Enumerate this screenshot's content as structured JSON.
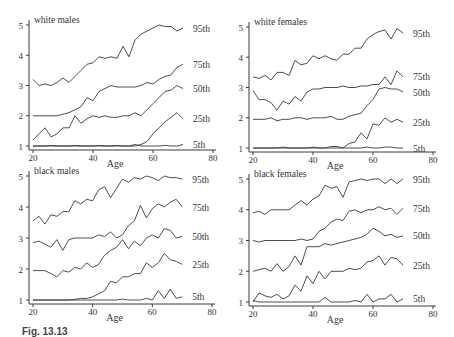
{
  "figure": {
    "caption_visible": "Fig. 13.13",
    "caption_note": "caption cut off at bottom edge"
  },
  "chart_data": [
    {
      "type": "line",
      "title": "white males",
      "xlabel": "Age",
      "ylabel": "",
      "xlim": [
        20,
        80
      ],
      "ylim": [
        1,
        5
      ],
      "xticks": [
        20,
        40,
        60,
        80
      ],
      "yticks": [
        1,
        2,
        3,
        4,
        5
      ],
      "grid": false,
      "legend_position": "right-end labels",
      "x": [
        20,
        22,
        24,
        26,
        28,
        30,
        32,
        34,
        36,
        38,
        40,
        42,
        44,
        46,
        48,
        50,
        52,
        54,
        56,
        58,
        60,
        62,
        64,
        66,
        68,
        70
      ],
      "series": [
        {
          "name": "95th",
          "values": [
            3.2,
            3.0,
            3.05,
            3.0,
            3.1,
            3.25,
            3.1,
            3.3,
            3.5,
            3.7,
            3.75,
            3.95,
            3.9,
            3.95,
            3.9,
            4.3,
            3.95,
            4.5,
            4.7,
            4.8,
            4.9,
            5.0,
            4.95,
            4.95,
            4.8,
            4.9
          ]
        },
        {
          "name": "75th",
          "values": [
            2.0,
            2.0,
            2.0,
            2.0,
            2.0,
            2.05,
            2.1,
            2.2,
            2.3,
            2.6,
            2.5,
            2.8,
            2.9,
            3.0,
            2.95,
            2.95,
            2.95,
            2.95,
            3.0,
            3.1,
            3.05,
            3.2,
            3.3,
            3.35,
            3.6,
            3.7
          ]
        },
        {
          "name": "50th",
          "values": [
            1.2,
            1.4,
            1.6,
            1.3,
            1.4,
            1.6,
            1.6,
            2.0,
            1.75,
            1.9,
            2.0,
            1.95,
            2.0,
            1.95,
            1.95,
            2.0,
            2.0,
            2.1,
            2.0,
            2.2,
            2.4,
            2.6,
            2.8,
            2.85,
            3.0,
            2.9
          ]
        },
        {
          "name": "25th",
          "values": [
            1.0,
            1.0,
            1.0,
            1.0,
            1.0,
            1.0,
            1.0,
            1.0,
            1.0,
            1.0,
            1.0,
            1.0,
            1.0,
            1.0,
            1.0,
            1.0,
            1.0,
            1.0,
            1.05,
            1.15,
            1.4,
            1.6,
            1.8,
            1.95,
            2.1,
            1.9
          ]
        },
        {
          "name": "5th",
          "values": [
            1.0,
            1.0,
            1.0,
            1.02,
            1.0,
            1.0,
            1.0,
            1.02,
            1.0,
            1.0,
            1.0,
            1.02,
            1.0,
            1.0,
            1.02,
            1.0,
            1.0,
            1.05,
            1.0,
            1.0,
            1.0,
            1.0,
            1.02,
            1.0,
            1.0,
            1.05
          ]
        }
      ]
    },
    {
      "type": "line",
      "title": "white females",
      "xlabel": "Age",
      "ylabel": "",
      "xlim": [
        20,
        80
      ],
      "ylim": [
        1,
        5
      ],
      "xticks": [
        20,
        40,
        60,
        80
      ],
      "yticks": [
        1,
        2,
        3,
        4,
        5
      ],
      "grid": false,
      "legend_position": "right-end labels",
      "x": [
        20,
        22,
        24,
        26,
        28,
        30,
        32,
        34,
        36,
        38,
        40,
        42,
        44,
        46,
        48,
        50,
        52,
        54,
        56,
        58,
        60,
        62,
        64,
        66,
        68,
        70
      ],
      "series": [
        {
          "name": "95th",
          "values": [
            3.35,
            3.3,
            3.4,
            3.25,
            3.5,
            3.5,
            3.4,
            3.9,
            3.75,
            3.8,
            4.05,
            3.95,
            4.05,
            3.95,
            3.9,
            4.1,
            4.1,
            4.3,
            4.3,
            4.6,
            4.75,
            4.85,
            4.9,
            4.6,
            4.95,
            4.8
          ]
        },
        {
          "name": "75th",
          "values": [
            2.9,
            2.6,
            2.6,
            2.5,
            2.25,
            2.55,
            2.45,
            2.7,
            2.55,
            2.85,
            2.95,
            2.95,
            3.0,
            3.0,
            3.0,
            3.05,
            3.0,
            3.0,
            3.05,
            3.05,
            3.1,
            3.1,
            3.35,
            3.1,
            3.55,
            3.35
          ]
        },
        {
          "name": "50th",
          "values": [
            1.95,
            1.95,
            1.95,
            2.0,
            1.9,
            1.95,
            1.95,
            2.0,
            2.0,
            1.95,
            2.0,
            2.0,
            2.0,
            2.05,
            1.95,
            1.95,
            2.05,
            2.1,
            2.15,
            2.4,
            2.6,
            2.95,
            3.0,
            2.95,
            2.95,
            2.85
          ]
        },
        {
          "name": "25th",
          "values": [
            1.0,
            1.0,
            1.0,
            1.0,
            1.0,
            1.0,
            1.0,
            1.0,
            1.0,
            1.0,
            1.0,
            1.0,
            1.0,
            1.0,
            1.0,
            1.0,
            1.15,
            1.2,
            1.5,
            1.3,
            1.8,
            1.75,
            2.0,
            1.85,
            1.95,
            1.85
          ]
        },
        {
          "name": "5th",
          "values": [
            1.0,
            1.0,
            1.0,
            1.0,
            1.0,
            1.03,
            1.0,
            1.0,
            1.0,
            1.0,
            1.03,
            1.0,
            1.0,
            1.05,
            1.05,
            1.0,
            1.0,
            1.0,
            1.0,
            1.03,
            1.0,
            1.0,
            1.03,
            1.03,
            1.0,
            1.0
          ]
        }
      ]
    },
    {
      "type": "line",
      "title": "black males",
      "xlabel": "Age",
      "ylabel": "",
      "xlim": [
        20,
        80
      ],
      "ylim": [
        1,
        5
      ],
      "xticks": [
        20,
        40,
        60,
        80
      ],
      "yticks": [
        1,
        2,
        3,
        4,
        5
      ],
      "grid": false,
      "legend_position": "right-end labels",
      "x": [
        20,
        22,
        24,
        26,
        28,
        30,
        32,
        34,
        36,
        38,
        40,
        42,
        44,
        46,
        48,
        50,
        52,
        54,
        56,
        58,
        60,
        62,
        64,
        66,
        68,
        70
      ],
      "series": [
        {
          "name": "95th",
          "values": [
            3.55,
            3.7,
            3.45,
            3.75,
            3.7,
            3.85,
            3.85,
            4.2,
            4.1,
            4.25,
            4.2,
            4.55,
            4.65,
            4.3,
            4.6,
            4.9,
            4.8,
            4.95,
            4.9,
            5.0,
            4.95,
            4.85,
            5.0,
            4.95,
            4.95,
            4.9
          ]
        },
        {
          "name": "75th",
          "values": [
            2.85,
            2.9,
            2.8,
            2.7,
            2.95,
            2.6,
            2.95,
            3.0,
            3.0,
            3.0,
            3.0,
            3.1,
            3.05,
            3.2,
            3.0,
            3.1,
            3.4,
            3.55,
            4.05,
            3.65,
            3.95,
            4.1,
            4.0,
            4.15,
            4.25,
            4.0
          ]
        },
        {
          "name": "50th",
          "values": [
            1.95,
            1.95,
            1.95,
            1.85,
            1.75,
            1.95,
            1.9,
            2.05,
            2.0,
            2.2,
            2.05,
            2.15,
            2.45,
            2.6,
            2.7,
            2.95,
            2.65,
            2.9,
            2.75,
            3.0,
            3.1,
            3.0,
            3.3,
            3.25,
            3.0,
            3.05
          ]
        },
        {
          "name": "25th",
          "values": [
            1.0,
            1.0,
            1.0,
            1.0,
            1.0,
            1.0,
            1.0,
            1.02,
            1.05,
            1.05,
            1.1,
            1.2,
            1.3,
            1.6,
            1.55,
            1.75,
            1.75,
            1.85,
            1.85,
            2.2,
            2.05,
            2.2,
            2.5,
            2.3,
            2.25,
            2.15
          ]
        },
        {
          "name": "5th",
          "values": [
            1.0,
            1.0,
            1.0,
            1.0,
            1.0,
            1.0,
            1.0,
            1.0,
            1.0,
            1.0,
            1.0,
            1.0,
            1.0,
            1.0,
            1.0,
            1.03,
            1.0,
            1.0,
            1.0,
            1.05,
            1.0,
            1.3,
            1.05,
            1.35,
            1.05,
            1.1
          ]
        }
      ]
    },
    {
      "type": "line",
      "title": "black females",
      "xlabel": "Age",
      "ylabel": "",
      "xlim": [
        20,
        80
      ],
      "ylim": [
        1,
        5
      ],
      "xticks": [
        20,
        40,
        60,
        80
      ],
      "yticks": [
        1,
        2,
        3,
        4,
        5
      ],
      "grid": false,
      "legend_position": "right-end labels",
      "x": [
        20,
        22,
        24,
        26,
        28,
        30,
        32,
        34,
        36,
        38,
        40,
        42,
        44,
        46,
        48,
        50,
        52,
        54,
        56,
        58,
        60,
        62,
        64,
        66,
        68,
        70
      ],
      "series": [
        {
          "name": "95th",
          "values": [
            3.9,
            3.95,
            3.85,
            4.0,
            4.0,
            4.0,
            4.0,
            4.15,
            4.3,
            4.15,
            4.35,
            4.45,
            4.8,
            4.7,
            4.75,
            4.4,
            4.9,
            4.95,
            5.0,
            4.95,
            5.0,
            5.0,
            4.85,
            5.0,
            4.85,
            5.0
          ]
        },
        {
          "name": "75th",
          "values": [
            3.0,
            2.95,
            3.0,
            3.0,
            3.0,
            3.0,
            3.0,
            3.0,
            3.05,
            3.0,
            3.05,
            3.3,
            3.4,
            3.6,
            3.7,
            3.65,
            3.95,
            4.0,
            3.9,
            4.0,
            4.0,
            4.1,
            4.0,
            4.05,
            3.85,
            4.05
          ]
        },
        {
          "name": "50th",
          "values": [
            2.0,
            2.05,
            2.1,
            2.0,
            2.25,
            2.0,
            2.15,
            2.5,
            2.2,
            2.8,
            2.8,
            2.8,
            2.9,
            2.85,
            2.9,
            2.95,
            3.0,
            3.05,
            3.1,
            3.2,
            3.4,
            3.3,
            3.15,
            3.2,
            3.1,
            3.15
          ]
        },
        {
          "name": "25th",
          "values": [
            1.0,
            1.3,
            1.2,
            1.15,
            1.25,
            1.1,
            1.2,
            1.55,
            1.35,
            1.85,
            1.6,
            2.0,
            1.75,
            2.0,
            2.0,
            2.0,
            2.1,
            2.05,
            2.1,
            2.3,
            2.35,
            2.5,
            2.2,
            2.45,
            2.4,
            2.2
          ]
        },
        {
          "name": "5th",
          "values": [
            1.05,
            1.0,
            1.0,
            1.0,
            1.0,
            1.0,
            1.0,
            1.0,
            1.0,
            1.0,
            1.0,
            1.0,
            1.15,
            1.0,
            1.0,
            1.0,
            1.0,
            1.05,
            1.0,
            1.25,
            1.0,
            1.1,
            1.1,
            1.25,
            1.0,
            1.1
          ]
        }
      ]
    }
  ],
  "panels_layout": [
    {
      "x0": 33,
      "x1": 213,
      "y5": 25,
      "y1": 146,
      "axis_x": 29,
      "axis_y": 150
    },
    {
      "x0": 253,
      "x1": 433,
      "y5": 27,
      "y1": 148,
      "axis_x": 249,
      "axis_y": 152
    },
    {
      "x0": 33,
      "x1": 212,
      "y5": 176,
      "y1": 300,
      "axis_x": 29,
      "axis_y": 304
    },
    {
      "x0": 253,
      "x1": 433,
      "y5": 179,
      "y1": 302,
      "axis_x": 249,
      "axis_y": 306
    }
  ],
  "style": {
    "line_color": "#3a3a3a",
    "text_color": "#333333",
    "background": "#ffffff"
  }
}
